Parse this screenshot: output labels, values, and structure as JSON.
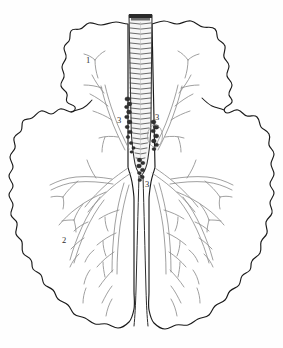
{
  "figure": {
    "background_color": "#fefefe",
    "width": 283,
    "height": 348
  },
  "colors": {
    "outline": "#1a1a1a",
    "bronchi": "#8a8a8a",
    "trachea_ring": "#3a3a3a",
    "trachea_fill": "#f4f4f4",
    "lymph_node": "#2a2a2a",
    "label": "#2b2b2b",
    "lung_fill": "#ffffff"
  },
  "labels": [
    {
      "id": "label-1",
      "text": "1",
      "x": 88,
      "y": 63,
      "refers_to": "left-upper-lobe"
    },
    {
      "id": "label-2",
      "text": "2",
      "x": 64,
      "y": 243,
      "refers_to": "left-lower-lobe-bronchi"
    },
    {
      "id": "label-3a",
      "text": "3",
      "x": 119,
      "y": 123,
      "refers_to": "paratracheal-lymph-nodes-left"
    },
    {
      "id": "label-3b",
      "text": "3",
      "x": 156,
      "y": 120,
      "refers_to": "paratracheal-lymph-nodes-right"
    },
    {
      "id": "label-3c",
      "text": "3",
      "x": 146,
      "y": 186,
      "refers_to": "carinal-lymph-nodes"
    }
  ],
  "parts": {
    "trachea": {
      "name": "trachea",
      "ring_count": 21,
      "top_y": 14,
      "bottom_y": 118
    },
    "carina": {
      "name": "carina",
      "y": 170
    },
    "left_lung": {
      "name": "left-lung",
      "lobes": 2
    },
    "right_lung": {
      "name": "right-lung",
      "lobes": 2
    },
    "lymph_nodes": {
      "name": "tracheobronchial-lymph-nodes",
      "cluster_count": 5
    }
  }
}
